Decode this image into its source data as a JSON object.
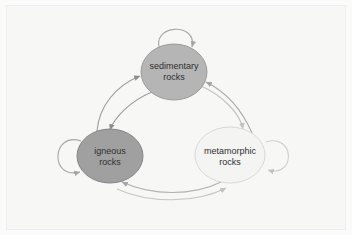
{
  "diagram": {
    "background_color": "#f7f7f6",
    "frame_color": "#efeeed",
    "nodes": [
      {
        "id": "sedimentary",
        "label_line1": "sedimentary",
        "label_line2": "rocks",
        "fill": "#b5b5b5",
        "stroke": "#9a9a9a",
        "cx": 174,
        "cy": 72,
        "rx": 33,
        "ry": 28
      },
      {
        "id": "igneous",
        "label_line1": "igneous",
        "label_line2": "rocks",
        "fill": "#a0a0a0",
        "stroke": "#848484",
        "cx": 110,
        "cy": 156,
        "rx": 33,
        "ry": 27
      },
      {
        "id": "metamorphic",
        "label_line1": "metamorphic",
        "label_line2": "rocks",
        "fill": "#f4f4f3",
        "stroke": "#d8d8d6",
        "cx": 230,
        "cy": 155,
        "rx": 35,
        "ry": 28
      }
    ],
    "edges": [
      {
        "id": "igneous-to-sedimentary",
        "from": "igneous",
        "to": "sedimentary",
        "stroke": "#9c9c9c"
      },
      {
        "id": "sedimentary-to-igneous",
        "from": "sedimentary",
        "to": "igneous",
        "stroke": "#9c9c9c"
      },
      {
        "id": "sedimentary-to-metamorphic",
        "from": "sedimentary",
        "to": "metamorphic",
        "stroke": "#c2c2c0"
      },
      {
        "id": "metamorphic-to-sedimentary",
        "from": "metamorphic",
        "to": "sedimentary",
        "stroke": "#a8a8a7"
      },
      {
        "id": "metamorphic-to-igneous",
        "from": "metamorphic",
        "to": "igneous",
        "stroke": "#b0b0ae"
      },
      {
        "id": "igneous-to-metamorphic",
        "from": "igneous",
        "to": "metamorphic",
        "stroke": "#c6c6c4"
      }
    ],
    "self_loops": [
      {
        "id": "sedimentary-self-loop",
        "node": "sedimentary",
        "stroke": "#a8a8a7"
      },
      {
        "id": "igneous-self-loop",
        "node": "igneous",
        "stroke": "#a8a8a7"
      },
      {
        "id": "metamorphic-self-loop",
        "node": "metamorphic",
        "stroke": "#cfcfcd"
      }
    ]
  }
}
